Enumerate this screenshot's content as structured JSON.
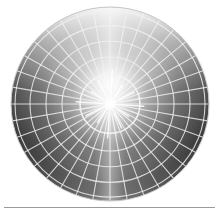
{
  "figure": {
    "title": "Shaded sphere with polar wireframe grid",
    "kind": "radial-grid-sphere-render",
    "background_color": "#ffffff",
    "canvas": {
      "width": 219,
      "height": 215
    },
    "disc": {
      "center_x": 110,
      "center_y": 104,
      "radius_x": 99,
      "radius_y": 97,
      "edge_color": "#b9b9b9"
    },
    "shading": {
      "description": "Specular starburst highlight at center, bright band toward top, darkening toward lower-left and lower-right limbs",
      "highlight_color": "#ffffff",
      "midtone_color": "#8e8e8e",
      "shadow_color": "#2b2b2b",
      "rim_color": "#707070",
      "top_light_color": "#d8d8d8"
    },
    "grid": {
      "line_color": "#f2f2f2",
      "line_width": 1.1,
      "spoke_count": 36,
      "ring_count": 5,
      "inner_ring_radius": 30,
      "ring_radii": [
        30,
        48,
        64,
        80,
        95
      ]
    },
    "starburst": {
      "ray_count": 24,
      "ray_length": 34,
      "core_radius": 7,
      "color": "#ffffff"
    }
  },
  "separator": {
    "color": "#9a9a9a",
    "label": "horizontal rule"
  },
  "chart_data": {
    "type": "scatter",
    "title": "Shaded sphere with polar wireframe grid",
    "xlabel": "",
    "ylabel": "",
    "categories": [
      "spokes",
      "rings"
    ],
    "values": [
      36,
      5
    ],
    "annotations": [
      "center specular highlight",
      "inner ring radius 30 px",
      "outer limb radius 99 px"
    ]
  }
}
